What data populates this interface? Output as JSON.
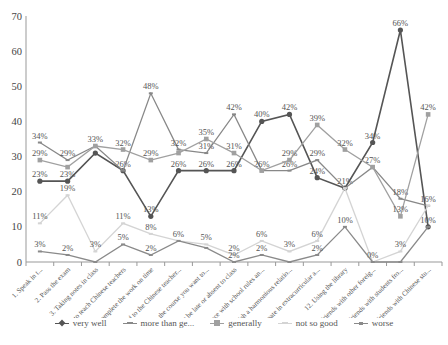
{
  "chart_data": {
    "type": "line",
    "title": "",
    "xlabel": "",
    "ylabel": "",
    "ylim": [
      0,
      70
    ],
    "yticks": [
      0,
      10,
      20,
      30,
      40,
      50,
      60,
      70
    ],
    "grid": false,
    "legend_position": "bottom",
    "categories": [
      "1. Speak in t...",
      "2. Pass the exam",
      "3. Taking notes in class",
      "4. Used to teach Chinese teachers",
      "5. Complete the work on time",
      "6. Get used to the Chinese teacher...",
      "7. Choose the course you want to...",
      "8. Not be late or absent to class",
      "9. Compliance with school rules an...",
      "10. Establish a harmonious relatio...",
      "11. Participate in extracurricular a...",
      "12. Using the library",
      "13. Make friends with other foreig...",
      "14. Make friends with students fro...",
      "15. Make friends with Chinese stu..."
    ],
    "series": [
      {
        "name": "very well",
        "color": "#555555",
        "marker": "diamond",
        "values": [
          23,
          23,
          31,
          26,
          13,
          26,
          26,
          26,
          40,
          42,
          24,
          21,
          34,
          66,
          10
        ],
        "labels": [
          "23%",
          "23%",
          "",
          "26%",
          "13%",
          "26%",
          "26%",
          "26%",
          "40%",
          "42%",
          "24%",
          "21%",
          "34%",
          "66%",
          "10%"
        ]
      },
      {
        "name": "more than ge...",
        "color": "#888888",
        "marker": "dash",
        "values": [
          34,
          29,
          33,
          26,
          48,
          32,
          31,
          42,
          26,
          26,
          29,
          21,
          27,
          18,
          16
        ],
        "labels": [
          "34%",
          "29%",
          "",
          "",
          "48%",
          "32%",
          "31%",
          "42%",
          "26%",
          "26%",
          "29%",
          "",
          "27%",
          "18%",
          "16%"
        ]
      },
      {
        "name": "generally",
        "color": "#a0a0a0",
        "marker": "square",
        "values": [
          29,
          27,
          33,
          32,
          29,
          31,
          35,
          31,
          26,
          29,
          39,
          32,
          27,
          13,
          42
        ],
        "labels": [
          "29%",
          "",
          "33%",
          "32%",
          "29%",
          "",
          "35%",
          "31%",
          "",
          "29%",
          "39%",
          "32%",
          "",
          "13%",
          "42%"
        ]
      },
      {
        "name": "not so good",
        "color": "#d4d4d4",
        "marker": "dash",
        "values": [
          11,
          19,
          3,
          11,
          8,
          6,
          5,
          2,
          6,
          3,
          6,
          21,
          0,
          3,
          16
        ],
        "labels": [
          "11%",
          "19%",
          "3%",
          "11%",
          "8%",
          "6%",
          "5%",
          "2%",
          "6%",
          "3%",
          "6%",
          "",
          "0%",
          "3%",
          ""
        ]
      },
      {
        "name": "worse",
        "color": "#8a8a8a",
        "marker": "dash",
        "values": [
          3,
          2,
          0,
          5,
          2,
          6,
          4,
          0,
          2,
          0,
          2,
          10,
          0,
          0,
          10
        ],
        "labels": [
          "3%",
          "2%",
          "",
          "5%",
          "2%",
          "",
          "",
          "2%",
          "2%",
          "",
          "2%",
          "10%",
          "",
          "",
          ""
        ]
      }
    ]
  },
  "legend": {
    "items": [
      {
        "label": "very well",
        "color": "#555555"
      },
      {
        "label": "more than ge...",
        "color": "#888888"
      },
      {
        "label": "generally",
        "color": "#a0a0a0"
      },
      {
        "label": "not so good",
        "color": "#d4d4d4"
      },
      {
        "label": "worse",
        "color": "#8a8a8a"
      }
    ]
  }
}
